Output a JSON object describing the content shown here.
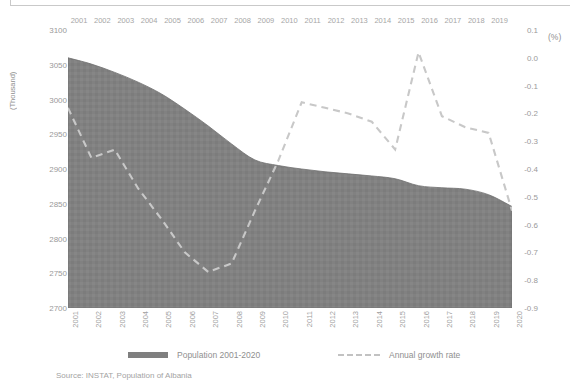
{
  "chart_data": {
    "type": "area",
    "title": "",
    "subtitle": "",
    "source_note": "Source: INSTAT, Population of Albania",
    "ylabel_left": "(Thousand)",
    "ylabel_right": "(%)",
    "xlabel": "",
    "grid": false,
    "legend_position": "bottom",
    "x_top": [
      "2001",
      "2002",
      "2003",
      "2004",
      "2005",
      "2006",
      "2007",
      "2008",
      "2009",
      "2010",
      "2011",
      "2012",
      "2013",
      "2014",
      "2015",
      "2016",
      "2017",
      "2018",
      "2019"
    ],
    "categories": [
      "2001",
      "2002",
      "2003",
      "2004",
      "2005",
      "2006",
      "2007",
      "2008",
      "2009",
      "2010",
      "2011",
      "2012",
      "2013",
      "2014",
      "2015",
      "2016",
      "2017",
      "2018",
      "2019",
      "2020"
    ],
    "ylim_left": [
      2700,
      3100
    ],
    "ylim_right": [
      -0.9,
      0.1
    ],
    "yticks_left": [
      "3100",
      "3050",
      "3000",
      "2950",
      "2900",
      "2850",
      "2800",
      "2750",
      "2700"
    ],
    "yticks_right": [
      "0.1",
      "0.0",
      "-0.1",
      "-0.2",
      "-0.3",
      "-0.4",
      "-0.5",
      "-0.6",
      "-0.7",
      "-0.8",
      "-0.9"
    ],
    "series": [
      {
        "name": "Population 2001-2020",
        "type": "area",
        "axis": "left",
        "color": "#808080",
        "values": [
          3060,
          3051,
          3039,
          3025,
          3008,
          2986,
          2962,
          2936,
          2913,
          2905,
          2900,
          2896,
          2893,
          2890,
          2886,
          2876,
          2873,
          2871,
          2863,
          2846
        ]
      },
      {
        "name": "Annual growth rate",
        "type": "line",
        "axis": "right",
        "color": "#c8c8c8",
        "dashed": true,
        "values": [
          -0.18,
          -0.36,
          -0.33,
          -0.47,
          -0.58,
          -0.7,
          -0.77,
          -0.74,
          -0.55,
          -0.37,
          -0.16,
          -0.18,
          -0.2,
          -0.23,
          -0.33,
          0.02,
          -0.21,
          -0.25,
          -0.27,
          -0.55
        ]
      }
    ]
  },
  "legend": {
    "population_label": "Population 2001-2020",
    "rate_label": "Annual growth rate"
  },
  "colors": {
    "area": "#808080",
    "line": "#c8c8c8",
    "text": "#8f8f8f",
    "background": "#ffffff"
  }
}
